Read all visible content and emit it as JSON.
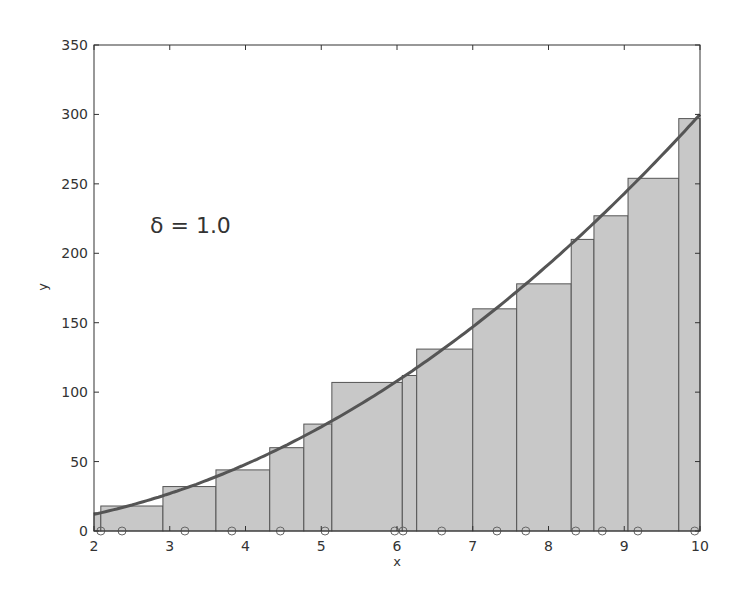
{
  "chart_data": {
    "type": "bar",
    "title": "",
    "xlabel": "x",
    "ylabel": "y",
    "xlim": [
      2,
      10
    ],
    "ylim": [
      0,
      350
    ],
    "grid": false,
    "x_ticks": [
      "2",
      "3",
      "4",
      "5",
      "6",
      "7",
      "8",
      "9",
      "10"
    ],
    "y_ticks": [
      "0",
      "50",
      "100",
      "150",
      "200",
      "250",
      "300",
      "350"
    ],
    "annotation": "δ = 1.0",
    "curve": {
      "name": "f(x) = 3x²",
      "function": "3*x^2",
      "color": "#555555"
    },
    "bars": [
      {
        "left": 2.0,
        "right": 2.09,
        "height": 13
      },
      {
        "left": 2.09,
        "right": 2.91,
        "height": 18
      },
      {
        "left": 2.91,
        "right": 3.61,
        "height": 32
      },
      {
        "left": 3.61,
        "right": 4.32,
        "height": 44
      },
      {
        "left": 4.32,
        "right": 4.77,
        "height": 60
      },
      {
        "left": 4.77,
        "right": 5.14,
        "height": 77
      },
      {
        "left": 5.14,
        "right": 6.07,
        "height": 107
      },
      {
        "left": 6.07,
        "right": 6.26,
        "height": 112
      },
      {
        "left": 6.26,
        "right": 7.0,
        "height": 131
      },
      {
        "left": 7.0,
        "right": 7.58,
        "height": 160
      },
      {
        "left": 7.58,
        "right": 8.3,
        "height": 178
      },
      {
        "left": 8.3,
        "right": 8.6,
        "height": 210
      },
      {
        "left": 8.6,
        "right": 9.05,
        "height": 227
      },
      {
        "left": 9.05,
        "right": 9.72,
        "height": 254
      },
      {
        "left": 9.72,
        "right": 10.0,
        "height": 297
      }
    ],
    "sample_points_x": [
      2.09,
      2.37,
      3.2,
      3.82,
      4.46,
      5.05,
      5.97,
      6.08,
      6.59,
      7.32,
      7.7,
      8.36,
      8.71,
      9.18,
      9.93
    ],
    "colors": {
      "bar_fill": "#c8c8c8",
      "bar_edge": "#555555",
      "curve": "#555555",
      "axes": "#333333"
    }
  }
}
